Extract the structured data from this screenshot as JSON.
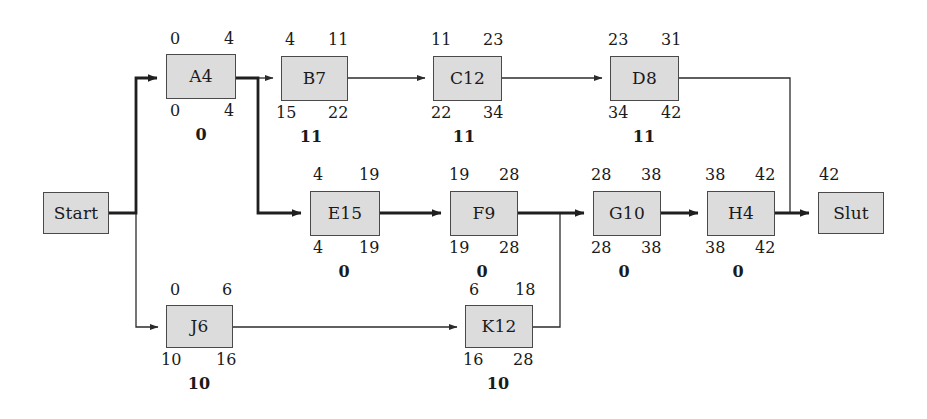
{
  "diagram": {
    "type": "activity-on-node-network",
    "colors": {
      "node_fill": "#dcdcdc",
      "node_border": "#4a4a4a",
      "edge": "#2b2b2b",
      "text": "#1a1a1a",
      "background": "#ffffff"
    },
    "nodes": [
      {
        "id": "start",
        "label": "Start",
        "x": 43,
        "y": 192,
        "w": 66,
        "h": 42,
        "critical": true,
        "es": "",
        "ef": "",
        "ls": "",
        "lf": "",
        "slack": ""
      },
      {
        "id": "a4",
        "label": "A4",
        "x": 166,
        "y": 54,
        "w": 70,
        "h": 45,
        "critical": true,
        "es": "0",
        "ef": "4",
        "ls": "0",
        "lf": "4",
        "slack": "0"
      },
      {
        "id": "b7",
        "label": "B7",
        "x": 281,
        "y": 56,
        "w": 67,
        "h": 45,
        "critical": false,
        "es": "4",
        "ef": "11",
        "ls": "15",
        "lf": "22",
        "slack": "11"
      },
      {
        "id": "c12",
        "label": "C12",
        "x": 433,
        "y": 56,
        "w": 69,
        "h": 45,
        "critical": false,
        "es": "11",
        "ef": "23",
        "ls": "22",
        "lf": "34",
        "slack": "11"
      },
      {
        "id": "d8",
        "label": "D8",
        "x": 610,
        "y": 56,
        "w": 69,
        "h": 45,
        "critical": false,
        "es": "23",
        "ef": "31",
        "ls": "34",
        "lf": "42",
        "slack": "11"
      },
      {
        "id": "e15",
        "label": "E15",
        "x": 310,
        "y": 191,
        "w": 70,
        "h": 45,
        "critical": true,
        "es": "4",
        "ef": "19",
        "ls": "4",
        "lf": "19",
        "slack": "0"
      },
      {
        "id": "f9",
        "label": "F9",
        "x": 450,
        "y": 191,
        "w": 68,
        "h": 45,
        "critical": true,
        "es": "19",
        "ef": "28",
        "ls": "19",
        "lf": "28",
        "slack": "0"
      },
      {
        "id": "g10",
        "label": "G10",
        "x": 593,
        "y": 191,
        "w": 68,
        "h": 45,
        "critical": true,
        "es": "28",
        "ef": "38",
        "ls": "28",
        "lf": "38",
        "slack": "0"
      },
      {
        "id": "h4",
        "label": "H4",
        "x": 707,
        "y": 191,
        "w": 68,
        "h": 45,
        "critical": true,
        "es": "38",
        "ef": "42",
        "ls": "38",
        "lf": "42",
        "slack": "0"
      },
      {
        "id": "slut",
        "label": "Slut",
        "x": 818,
        "y": 192,
        "w": 66,
        "h": 42,
        "critical": true,
        "es": "42",
        "ef": "",
        "ls": "",
        "lf": "",
        "slack": ""
      },
      {
        "id": "j6",
        "label": "J6",
        "x": 166,
        "y": 305,
        "w": 67,
        "h": 43,
        "critical": false,
        "es": "0",
        "ef": "6",
        "ls": "10",
        "lf": "16",
        "slack": "10"
      },
      {
        "id": "k12",
        "label": "K12",
        "x": 465,
        "y": 305,
        "w": 68,
        "h": 43,
        "critical": false,
        "es": "6",
        "ef": "18",
        "ls": "16",
        "lf": "28",
        "slack": "10"
      }
    ],
    "edges": [
      {
        "from": "start",
        "to": "a4",
        "critical": true
      },
      {
        "from": "start",
        "to": "j6",
        "critical": false
      },
      {
        "from": "a4",
        "to": "b7",
        "critical": false
      },
      {
        "from": "a4",
        "to": "e15",
        "critical": true
      },
      {
        "from": "b7",
        "to": "c12",
        "critical": false
      },
      {
        "from": "c12",
        "to": "d8",
        "critical": false
      },
      {
        "from": "d8",
        "to": "slut",
        "critical": false
      },
      {
        "from": "e15",
        "to": "f9",
        "critical": true
      },
      {
        "from": "f9",
        "to": "g10",
        "critical": true
      },
      {
        "from": "g10",
        "to": "h4",
        "critical": true
      },
      {
        "from": "h4",
        "to": "slut",
        "critical": true
      },
      {
        "from": "j6",
        "to": "k12",
        "critical": false
      },
      {
        "from": "k12",
        "to": "g10",
        "critical": false
      }
    ],
    "critical_path": [
      "Start",
      "A4",
      "E15",
      "F9",
      "G10",
      "H4",
      "Slut"
    ],
    "project_duration": "42"
  }
}
